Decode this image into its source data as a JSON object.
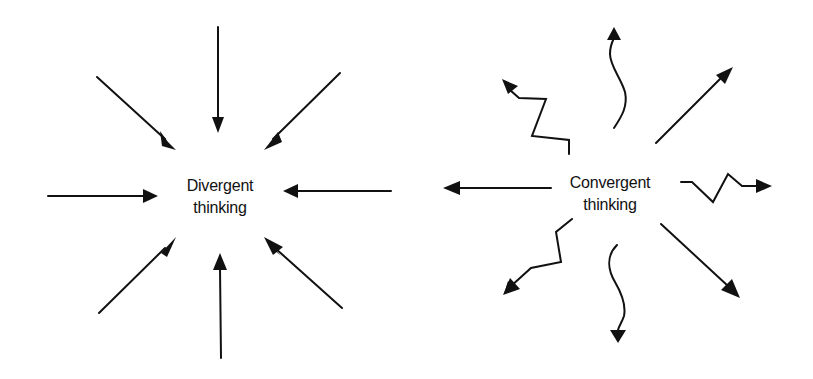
{
  "diagrams": [
    {
      "id": "divergent",
      "label_line1": "Divergent",
      "label_line2": "thinking",
      "center": [
        220,
        198
      ],
      "arrow_direction": "inward",
      "arrow_style": "straight",
      "arrow_count": 8
    },
    {
      "id": "convergent",
      "label_line1": "Convergent",
      "label_line2": "thinking",
      "center": [
        610,
        198
      ],
      "arrow_direction": "outward",
      "arrow_style": "mixed straight, zigzag and wavy",
      "arrow_count": 8
    }
  ],
  "colors": {
    "stroke": "#111111",
    "background": "#ffffff"
  }
}
